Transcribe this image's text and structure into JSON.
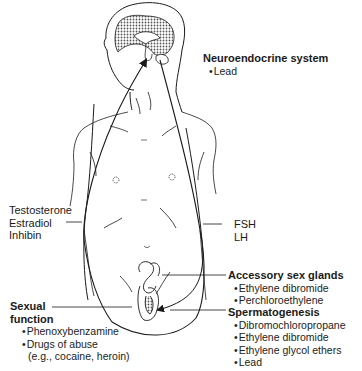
{
  "figure": {
    "labels": {
      "neuroendocrine": {
        "heading": "Neuroendocrine system",
        "items": [
          "Lead"
        ]
      },
      "left_hormones": [
        "Testosterone",
        "Estradiol",
        "Inhibin"
      ],
      "right_hormones": [
        "FSH",
        "LH"
      ],
      "accessory": {
        "heading": "Accessory sex glands",
        "items": [
          "Ethylene dibromide",
          "Perchloroethylene"
        ]
      },
      "spermatogenesis": {
        "heading": "Spermatogenesis",
        "items": [
          "Dibromochloropropane",
          "Ethylene dibromide",
          "Ethylene glycol ethers",
          "Lead"
        ]
      },
      "sexual_function": {
        "heading_line1": "Sexual",
        "heading_line2": "function",
        "items": [
          "Phenoxybenzamine",
          "Drugs of abuse"
        ],
        "item_continuation": "(e.g., cocaine, heroin)"
      }
    },
    "colors": {
      "line": "#1a1a1a",
      "brain_fill": "#bdbdbd"
    }
  }
}
